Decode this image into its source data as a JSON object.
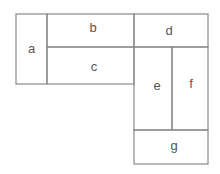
{
  "diagram": {
    "type": "rectangle-partition",
    "stroke_color": "#8a8a8a",
    "label_color": "#555555",
    "regions": [
      {
        "id": "a",
        "label": "a",
        "x": 16,
        "y": 14,
        "w": 31,
        "h": 70
      },
      {
        "id": "b",
        "label": "b",
        "x": 47,
        "y": 14,
        "w": 87,
        "h": 33
      },
      {
        "id": "c",
        "label": "c",
        "x": 47,
        "y": 47,
        "w": 87,
        "h": 37
      },
      {
        "id": "d",
        "label": "d",
        "x": 134,
        "y": 14,
        "w": 74,
        "h": 33
      },
      {
        "id": "e",
        "label": "e",
        "x": 134,
        "y": 47,
        "w": 38,
        "h": 83
      },
      {
        "id": "f",
        "label": "f",
        "x": 172,
        "y": 47,
        "w": 36,
        "h": 83
      },
      {
        "id": "g",
        "label": "g",
        "x": 134,
        "y": 130,
        "w": 74,
        "h": 34
      }
    ]
  }
}
